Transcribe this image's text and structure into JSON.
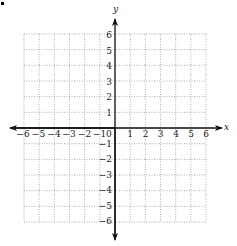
{
  "chart_data": {
    "type": "coordinate-plane",
    "title": "",
    "xlabel": "x",
    "ylabel": "y",
    "xlim": [
      -6,
      6
    ],
    "ylim": [
      -6,
      6
    ],
    "grid": true,
    "grid_style": "dotted",
    "x_ticks": [
      -6,
      -5,
      -4,
      -3,
      -2,
      -1,
      1,
      2,
      3,
      4,
      5,
      6
    ],
    "y_ticks": [
      -6,
      -5,
      -4,
      -3,
      -2,
      -1,
      1,
      2,
      3,
      4,
      5,
      6
    ],
    "origin_label": "0",
    "series": []
  },
  "labels": {
    "x_axis": "x",
    "y_axis": "y",
    "origin": "0",
    "x_neg": [
      "−6",
      "−5",
      "−4",
      "−3",
      "−2",
      "−1"
    ],
    "x_pos": [
      "1",
      "2",
      "3",
      "4",
      "5",
      "6"
    ],
    "y_pos": [
      "1",
      "2",
      "3",
      "4",
      "5",
      "6"
    ],
    "y_neg": [
      "−1",
      "−2",
      "−3",
      "−4",
      "−5",
      "−6"
    ]
  },
  "colors": {
    "grid": "#9a9a9a",
    "axis": "#111111",
    "text": "#222222"
  }
}
